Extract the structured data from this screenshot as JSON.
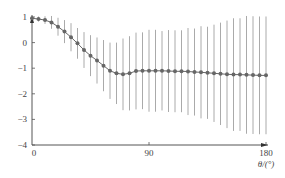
{
  "chart_data": {
    "type": "line",
    "title": "",
    "xlabel": "θ/(°)",
    "ylabel": "",
    "xlim": [
      0,
      180
    ],
    "ylim": [
      -4,
      1
    ],
    "xticks": [
      "0",
      "90",
      "180"
    ],
    "yticks": [
      "1",
      "0",
      "-1",
      "-2",
      "-3",
      "-4"
    ],
    "grid": false,
    "legend": null,
    "series": [
      {
        "name": "mean",
        "x": [
          0,
          5,
          10,
          15,
          20,
          25,
          30,
          35,
          40,
          45,
          50,
          55,
          60,
          65,
          70,
          75,
          80,
          85,
          90,
          95,
          100,
          105,
          110,
          115,
          120,
          125,
          130,
          135,
          140,
          145,
          150,
          155,
          160,
          165,
          170,
          175,
          180
        ],
        "values": [
          0.95,
          0.92,
          0.88,
          0.79,
          0.62,
          0.43,
          0.21,
          -0.03,
          -0.29,
          -0.51,
          -0.7,
          -0.9,
          -1.1,
          -1.2,
          -1.24,
          -1.2,
          -1.11,
          -1.1,
          -1.1,
          -1.1,
          -1.1,
          -1.11,
          -1.12,
          -1.12,
          -1.13,
          -1.15,
          -1.16,
          -1.18,
          -1.2,
          -1.22,
          -1.24,
          -1.25,
          -1.25,
          -1.26,
          -1.27,
          -1.28,
          -1.28
        ],
        "error": [
          0.05,
          0.1,
          0.15,
          0.25,
          0.35,
          0.45,
          0.55,
          0.6,
          0.7,
          0.8,
          0.9,
          1.0,
          1.1,
          1.2,
          1.4,
          1.45,
          1.5,
          1.5,
          1.6,
          1.6,
          1.55,
          1.6,
          1.6,
          1.6,
          1.7,
          1.7,
          1.8,
          1.8,
          1.9,
          2.0,
          2.1,
          2.2,
          2.2,
          2.3,
          2.3,
          2.3,
          2.3
        ]
      }
    ]
  }
}
